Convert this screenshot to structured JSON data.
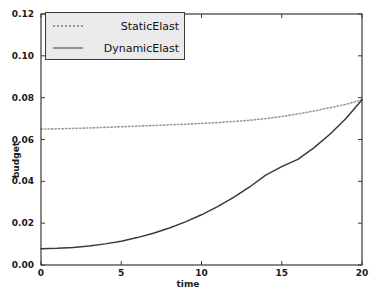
{
  "chart_data": {
    "type": "line",
    "title": "",
    "xlabel": "time",
    "ylabel": "budget",
    "xlim": [
      0,
      20
    ],
    "ylim": [
      0.0,
      0.12
    ],
    "grid": false,
    "legend_position": "upper left",
    "xticks": [
      "0",
      "5",
      "10",
      "15",
      "20"
    ],
    "xtick_values": [
      0,
      5,
      10,
      15,
      20
    ],
    "yticks": [
      "0.00",
      "0.02",
      "0.04",
      "0.06",
      "0.08",
      "0.10",
      "0.12"
    ],
    "ytick_values": [
      0.0,
      0.02,
      0.04,
      0.06,
      0.08,
      0.1,
      0.12
    ],
    "x": [
      0,
      1,
      2,
      3,
      4,
      5,
      6,
      7,
      8,
      9,
      10,
      11,
      12,
      13,
      14,
      15,
      16,
      17,
      18,
      19,
      20
    ],
    "series": [
      {
        "name": "StaticElast",
        "style": "dotted",
        "color": "#9a9a9a",
        "values": [
          0.065,
          0.0651,
          0.0653,
          0.0655,
          0.0658,
          0.0661,
          0.0664,
          0.0667,
          0.067,
          0.0673,
          0.0677,
          0.0681,
          0.0686,
          0.0692,
          0.07,
          0.071,
          0.0722,
          0.0736,
          0.0752,
          0.0768,
          0.079
        ]
      },
      {
        "name": "DynamicElast",
        "style": "solid",
        "color": "#3a3a3a",
        "values": [
          0.0078,
          0.008,
          0.0084,
          0.0091,
          0.0101,
          0.0114,
          0.0131,
          0.0152,
          0.0177,
          0.0206,
          0.024,
          0.0279,
          0.0323,
          0.0373,
          0.043,
          0.047,
          0.0505,
          0.056,
          0.0625,
          0.07,
          0.079
        ]
      }
    ]
  },
  "axes": {
    "frame_color": "#3a3a3a"
  }
}
